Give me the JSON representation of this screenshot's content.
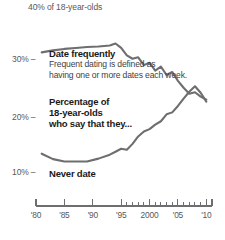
{
  "chart_data": {
    "type": "line",
    "title": "",
    "subtitle": "",
    "xlabel": "",
    "ylabel": "",
    "top_axis_label": "40% of 18-year-olds",
    "ylim": [
      5,
      42
    ],
    "yticks": [
      30,
      20,
      10
    ],
    "ytick_labels": [
      "30%",
      "20%",
      "10%"
    ],
    "ytick_dash": "–",
    "xlim": [
      1980,
      2011
    ],
    "xtick_labels": [
      "'80",
      "'85",
      "'90",
      "'95",
      "2000",
      "'05",
      "'10"
    ],
    "xtick_values": [
      1980,
      1985,
      1990,
      1995,
      2000,
      2005,
      2010
    ],
    "minor_ticks_start": 1995,
    "minor_ticks_end": 2011,
    "grid": false,
    "legend": "inline-annotations",
    "series": [
      {
        "name": "Date frequently",
        "x": [
          1981,
          1983,
          1985,
          1987,
          1989,
          1991,
          1993,
          1994,
          1995,
          1996,
          1997,
          1998,
          1999,
          2000,
          2001,
          2002,
          2003,
          2004,
          2005,
          2006,
          2007,
          2008,
          2009,
          2010
        ],
        "values": [
          34.2,
          34.6,
          34.9,
          35.1,
          35.3,
          35.4,
          35.6,
          36.0,
          35.1,
          33.6,
          32.9,
          33.2,
          31.6,
          32.1,
          30.5,
          31.3,
          29.6,
          30.2,
          28.4,
          27.0,
          25.8,
          26.1,
          25.2,
          24.6
        ]
      },
      {
        "name": "Never date",
        "x": [
          1981,
          1983,
          1985,
          1987,
          1989,
          1991,
          1993,
          1994,
          1995,
          1996,
          1997,
          1998,
          1999,
          2000,
          2001,
          2002,
          2003,
          2004,
          2005,
          2006,
          2007,
          2008,
          2009,
          2010
        ],
        "values": [
          13.6,
          12.5,
          12.0,
          12.0,
          12.0,
          12.6,
          13.4,
          14.0,
          14.6,
          14.4,
          15.6,
          17.1,
          18.1,
          18.6,
          19.5,
          20.2,
          21.6,
          22.0,
          23.3,
          24.8,
          26.2,
          27.3,
          26.0,
          24.2
        ]
      }
    ],
    "annotations": [
      {
        "id": "date-frequently",
        "title": "Date frequently",
        "body_line1": "Frequent dating is defined as",
        "body_line2": "having one or more dates each week."
      },
      {
        "id": "percentage",
        "title_line1": "Percentage of",
        "title_line2": "18-year-olds",
        "title_line3": "who say that they..."
      },
      {
        "id": "never-date",
        "title": "Never date"
      }
    ],
    "colors": {
      "line": "#6e6e70",
      "axis": "#6e6e70",
      "label": "#58585a",
      "annotation_title": "#1a1a1a",
      "annotation_body": "#3f3f41",
      "background": "#ffffff"
    }
  }
}
